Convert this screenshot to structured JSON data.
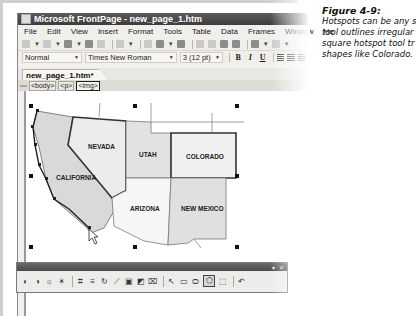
{
  "window": {
    "title": "Microsoft FrontPage - new_page_1.htm"
  },
  "menu": {
    "items": [
      "File",
      "Edit",
      "View",
      "Insert",
      "Format",
      "Tools",
      "Table",
      "Data",
      "Frames",
      "Window",
      "He"
    ]
  },
  "standard_toolbar": {
    "icons": [
      "new-page-icon",
      "open-icon",
      "save-icon",
      "search-icon",
      "publish-icon",
      "toggle-pane-icon",
      "print-icon",
      "preview-icon",
      "spelling-icon",
      "cut-icon",
      "copy-icon",
      "paste-icon",
      "format-painter-icon",
      "undo-icon",
      "redo-icon"
    ]
  },
  "formatting_toolbar": {
    "style": "Normal",
    "font": "Times New Roman",
    "size": "3 (12 pt)",
    "bold": "B",
    "italic": "I",
    "underline": "U"
  },
  "document_tab": {
    "label": "new_page_1.htm*"
  },
  "quick_tag_bar": {
    "tags": [
      "<body>",
      "<p>",
      "<img>"
    ],
    "selected": "<img>"
  },
  "map_image": {
    "states": [
      "NEVADA",
      "UTAH",
      "COLORADO",
      "CALIFORNIA",
      "ARIZONA",
      "NEW MEXICO"
    ],
    "hotspots": [
      "COLORADO",
      "NEVADA",
      "CALIFORNIA"
    ]
  },
  "pictures_toolbar": {
    "title_controls": [
      "▾",
      "✕"
    ],
    "tools": [
      "more-contrast",
      "less-contrast",
      "more-brightness",
      "less-brightness",
      "crop",
      "line-style",
      "flip",
      "rotate",
      "color",
      "bevel",
      "resample",
      "select",
      "rectangular-hotspot",
      "circular-hotspot",
      "polygonal-hotspot",
      "highlight-hotspots",
      "restore"
    ],
    "active_tool": "polygonal-hotspot"
  },
  "caption": {
    "title": "Figure 4-9:",
    "lines": [
      "Hotspots can be any s",
      "tool outlines irregular",
      "square hotspot tool tr",
      "shapes like Colorado."
    ]
  }
}
